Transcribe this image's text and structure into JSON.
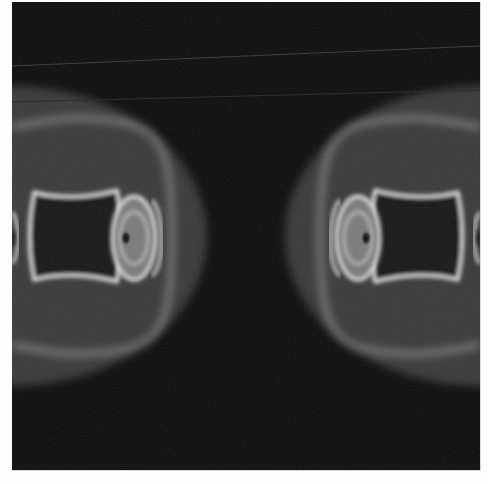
{
  "image": {
    "description": "Grayscale field intensity pattern showing two mirrored lobes with concentric bright rings on a dark background",
    "colors": {
      "background": "#0a0a0a",
      "halo": "#9a9a9a",
      "ring": "#e8e8e8",
      "core": "#1a1a1a",
      "page": "#fdfdfd"
    },
    "lobes": [
      {
        "side": "left",
        "cx": 40,
        "cy": 235
      },
      {
        "side": "right",
        "cx": 440,
        "cy": 235
      }
    ]
  }
}
